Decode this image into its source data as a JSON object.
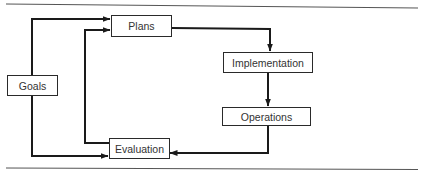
{
  "diagram": {
    "type": "flowchart",
    "nodes": {
      "goals": {
        "label": "Goals"
      },
      "plans": {
        "label": "Plans"
      },
      "implementation": {
        "label": "Implementation"
      },
      "operations": {
        "label": "Operations"
      },
      "evaluation": {
        "label": "Evaluation"
      }
    },
    "edges": [
      {
        "from": "Goals",
        "to": "Plans"
      },
      {
        "from": "Goals",
        "to": "Evaluation"
      },
      {
        "from": "Plans",
        "to": "Implementation"
      },
      {
        "from": "Implementation",
        "to": "Operations"
      },
      {
        "from": "Operations",
        "to": "Evaluation"
      },
      {
        "from": "Evaluation",
        "to": "Plans"
      }
    ],
    "colors": {
      "line": "#1a1a1a",
      "rule": "#555555",
      "text": "#333333"
    }
  }
}
